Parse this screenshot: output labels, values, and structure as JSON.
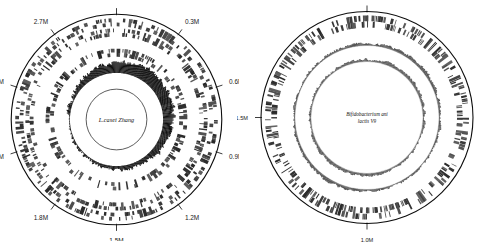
{
  "figure": {
    "background_color": "#ffffff",
    "stroke_color": "#0d0d0d",
    "panel_count": 2
  },
  "panels": [
    {
      "id": "panel-left",
      "organism": "L.casei Zhang",
      "center_label_lines": [
        "L.casei Zhang"
      ],
      "center_x": 120,
      "center_y": 120,
      "outer_radius": 112,
      "fully_visible": true,
      "axis": {
        "unit": "M",
        "start_label": "0",
        "genome_length": 3000000,
        "tick_labels": [
          "0",
          "0.3M",
          "0.6M",
          "0.9M",
          "1.2M",
          "1.5M",
          "1.8M",
          "2.1M",
          "2.4M",
          "2.7M"
        ],
        "tick_positions_bp": [
          0,
          300000,
          600000,
          900000,
          1200000,
          1500000,
          1800000,
          2100000,
          2400000,
          2700000
        ],
        "tick_angles_deg": [
          0,
          36,
          72,
          108,
          144,
          180,
          216,
          252,
          288,
          324
        ]
      },
      "rings": [
        {
          "name": "backbone-circle",
          "type": "circle",
          "r_outer": 104,
          "r_inner": 104,
          "color": "#0d0d0d",
          "stroke_width": 1.1
        },
        {
          "name": "forward-cds-ring",
          "type": "features",
          "r_outer": 100,
          "r_inner": 92,
          "color": "#2b2b2b",
          "feature_count": 300,
          "density": 0.62
        },
        {
          "name": "reverse-cds-ring",
          "type": "features",
          "r_outer": 90,
          "r_inner": 82,
          "color": "#3a3a3a",
          "feature_count": 300,
          "density": 0.6
        },
        {
          "name": "rna-feature-ring",
          "type": "features",
          "r_outer": 70,
          "r_inner": 62,
          "color": "#444444",
          "feature_count": 220,
          "density": 0.52
        },
        {
          "name": "gc-content-plot",
          "type": "histogram",
          "r_base": 46,
          "amplitude": 13,
          "color": "#111111",
          "bar_count": 360
        },
        {
          "name": "inner-circle-outline",
          "type": "circle",
          "r_outer": 30,
          "r_inner": 30,
          "color": "#1a1a1a",
          "stroke_width": 0.7
        }
      ]
    },
    {
      "id": "panel-right",
      "organism": "Bifidobacterium animalis lactis V9",
      "center_label_lines": [
        "Bifidobacterium ani",
        "lactis V9"
      ],
      "center_x": 130,
      "center_y": 120,
      "outer_radius": 112,
      "fully_visible": false,
      "axis": {
        "unit": "M",
        "start_label": "0",
        "genome_length": 2000000,
        "tick_labels": [
          "0",
          "1.0M",
          "1.5M"
        ],
        "tick_positions_bp": [
          0,
          1000000,
          1500000
        ],
        "tick_angles_deg": [
          0,
          180,
          270
        ]
      },
      "rings": [
        {
          "name": "backbone-circle",
          "type": "circle",
          "r_outer": 106,
          "r_inner": 106,
          "color": "#0d0d0d",
          "stroke_width": 1.1
        },
        {
          "name": "cds-feature-ring",
          "type": "features",
          "r_outer": 102,
          "r_inner": 90,
          "color": "#2b2b2b",
          "feature_count": 420,
          "density": 0.58
        },
        {
          "name": "gc-skew-outer-plot",
          "type": "histogram",
          "r_base": 72,
          "amplitude": 4,
          "color": "#555555",
          "bar_count": 420
        },
        {
          "name": "gc-content-inner-plot",
          "type": "histogram",
          "r_base": 56,
          "amplitude": 4,
          "color": "#555555",
          "bar_count": 420
        }
      ]
    }
  ]
}
